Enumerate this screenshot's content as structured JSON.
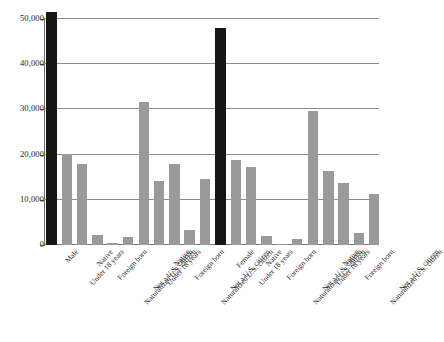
{
  "chart_data": {
    "type": "bar",
    "title": "",
    "subtitle": "",
    "xlabel": "",
    "ylabel": "",
    "ylim": [
      0,
      52000
    ],
    "grid": true,
    "legend": "none",
    "y_ticks": [
      "0",
      "10,000",
      "20,000",
      "30,000",
      "40,000",
      "50,000"
    ],
    "y_tick_values": [
      0,
      10000,
      20000,
      30000,
      40000,
      50000
    ],
    "categories": [
      "Male",
      "Under 18 years",
      "Native",
      "Foreign born",
      "Naturalized U.S. citizen",
      "Not a U.S. citizen",
      "Under 18 years",
      "Native",
      "Foreign born",
      "Naturalized U.S. citizen",
      "Not a U.S. citizen",
      "Female",
      "Under 18 years",
      "Native",
      "Foreign born",
      "Naturalized U.S. citizen",
      "Not a U.S. citizen",
      "Under 18 years",
      "Native",
      "Foreign born",
      "Naturalized U.S. citizen",
      "Not a U.S. citizen"
    ],
    "values": [
      51500,
      20200,
      18000,
      2200,
      400,
      1700,
      31700,
      14200,
      18000,
      3400,
      14700,
      48100,
      18800,
      17300,
      1900,
      300,
      1300,
      29600,
      16400,
      13800,
      2600,
      11200
    ],
    "bar_kinds": [
      "total",
      "detail",
      "detail",
      "detail",
      "detail",
      "detail",
      "detail",
      "detail",
      "detail",
      "detail",
      "detail",
      "total",
      "detail",
      "detail",
      "detail",
      "detail",
      "detail",
      "detail",
      "detail",
      "detail",
      "detail",
      "detail"
    ],
    "colors": {
      "total_bar": "#161616",
      "detail_bar": "#9a9a9a",
      "gridline": "#8d8d8d",
      "axis": "#6e6e6e",
      "background": "#ffffff",
      "text": "#1c1c1c"
    }
  }
}
